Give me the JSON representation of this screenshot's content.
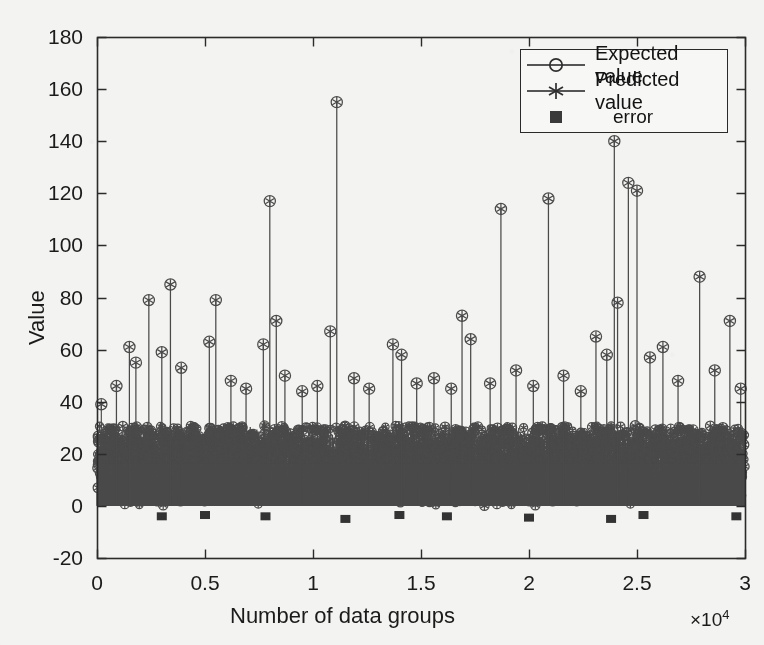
{
  "chart_data": {
    "type": "line",
    "title": "",
    "xlabel": "Number of data groups",
    "ylabel": "Value",
    "x_multiplier": "×10",
    "x_multiplier_exp": "4",
    "xlim": [
      0,
      30000
    ],
    "ylim": [
      -20,
      180
    ],
    "xticks": [
      0,
      5000,
      10000,
      15000,
      20000,
      25000,
      30000
    ],
    "xticklabels": [
      "0",
      "0.5",
      "1",
      "1.5",
      "2",
      "2.5",
      "3"
    ],
    "yticks": [
      -20,
      0,
      20,
      40,
      60,
      80,
      100,
      120,
      140,
      160,
      180
    ],
    "yticklabels": [
      "-20",
      "0",
      "20",
      "40",
      "60",
      "80",
      "100",
      "120",
      "140",
      "160",
      "180"
    ],
    "grid": false,
    "legend_position": "top-right",
    "series": [
      {
        "name": "Expected value",
        "marker": "circle",
        "style": "stem",
        "color": "#4a4a4a",
        "description": "Dense stem plot of ~30000 expected values; bulk of samples lie between 0 and 28 forming a solid dark band, with isolated tall stems reaching up to 155.",
        "bulk_range": [
          0,
          28
        ],
        "peaks": [
          {
            "x": 200,
            "y": 39
          },
          {
            "x": 900,
            "y": 46
          },
          {
            "x": 1500,
            "y": 61
          },
          {
            "x": 1800,
            "y": 55
          },
          {
            "x": 2400,
            "y": 79
          },
          {
            "x": 3000,
            "y": 59
          },
          {
            "x": 3400,
            "y": 85
          },
          {
            "x": 3900,
            "y": 53
          },
          {
            "x": 5200,
            "y": 63
          },
          {
            "x": 5500,
            "y": 79
          },
          {
            "x": 6200,
            "y": 48
          },
          {
            "x": 6900,
            "y": 45
          },
          {
            "x": 7700,
            "y": 62
          },
          {
            "x": 8000,
            "y": 117
          },
          {
            "x": 8300,
            "y": 71
          },
          {
            "x": 8700,
            "y": 50
          },
          {
            "x": 9500,
            "y": 44
          },
          {
            "x": 10200,
            "y": 46
          },
          {
            "x": 10800,
            "y": 67
          },
          {
            "x": 11100,
            "y": 155
          },
          {
            "x": 11900,
            "y": 49
          },
          {
            "x": 12600,
            "y": 45
          },
          {
            "x": 13700,
            "y": 62
          },
          {
            "x": 14100,
            "y": 58
          },
          {
            "x": 14800,
            "y": 47
          },
          {
            "x": 15600,
            "y": 49
          },
          {
            "x": 16400,
            "y": 45
          },
          {
            "x": 16900,
            "y": 73
          },
          {
            "x": 17300,
            "y": 64
          },
          {
            "x": 18200,
            "y": 47
          },
          {
            "x": 18700,
            "y": 114
          },
          {
            "x": 19400,
            "y": 52
          },
          {
            "x": 20200,
            "y": 46
          },
          {
            "x": 20900,
            "y": 118
          },
          {
            "x": 21600,
            "y": 50
          },
          {
            "x": 22400,
            "y": 44
          },
          {
            "x": 23100,
            "y": 65
          },
          {
            "x": 23600,
            "y": 58
          },
          {
            "x": 23950,
            "y": 140
          },
          {
            "x": 24100,
            "y": 78
          },
          {
            "x": 24600,
            "y": 124
          },
          {
            "x": 25000,
            "y": 121
          },
          {
            "x": 25600,
            "y": 57
          },
          {
            "x": 26200,
            "y": 61
          },
          {
            "x": 26900,
            "y": 48
          },
          {
            "x": 27900,
            "y": 88
          },
          {
            "x": 28600,
            "y": 52
          },
          {
            "x": 29300,
            "y": 71
          },
          {
            "x": 29800,
            "y": 45
          }
        ]
      },
      {
        "name": "Predicted value",
        "marker": "asterisk",
        "style": "stem",
        "color": "#4a4a4a",
        "description": "Predicted values overlay the expected values almost exactly; asterisk markers sit inside the circle markers."
      },
      {
        "name": "error",
        "marker": "square",
        "style": "points",
        "color": "#333333",
        "description": "Residual error markers plotted just below zero, around -3 to -5.",
        "level": -4,
        "points": [
          {
            "x": 3000,
            "y": -4
          },
          {
            "x": 5000,
            "y": -3.5
          },
          {
            "x": 7800,
            "y": -4
          },
          {
            "x": 11500,
            "y": -5
          },
          {
            "x": 14000,
            "y": -3.5
          },
          {
            "x": 16200,
            "y": -4
          },
          {
            "x": 20000,
            "y": -4.5
          },
          {
            "x": 23800,
            "y": -5
          },
          {
            "x": 25300,
            "y": -3.5
          },
          {
            "x": 29600,
            "y": -4
          }
        ]
      }
    ]
  },
  "legend": {
    "items": [
      {
        "label": "Expected value",
        "marker": "circle"
      },
      {
        "label": "Predicted value",
        "marker": "asterisk"
      },
      {
        "label": "error",
        "marker": "square"
      }
    ]
  }
}
